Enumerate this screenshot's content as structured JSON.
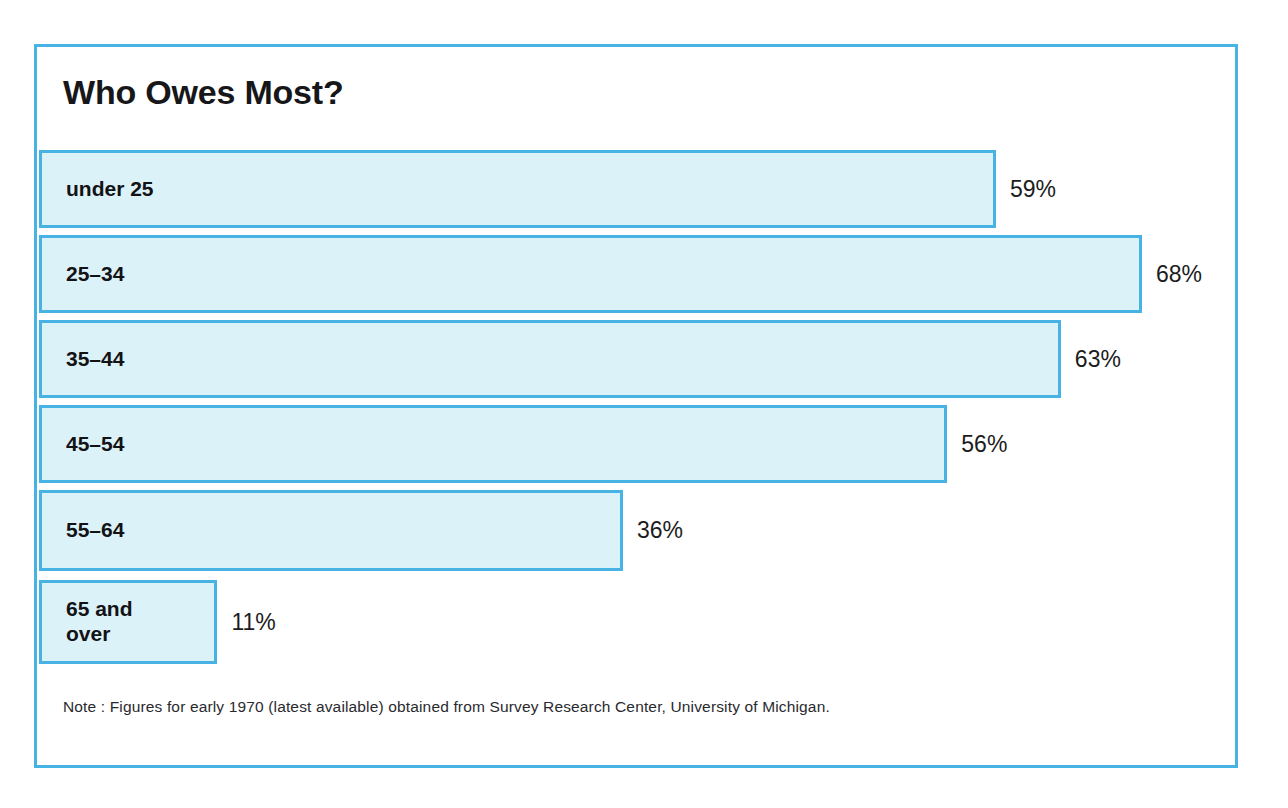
{
  "figure": {
    "title": "Who Owes Most?",
    "footnote": "Note : Figures for early 1970 (latest available) obtained from Survey Research Center, University of Michigan.",
    "border_color": "#46b3e4",
    "bar_fill_color": "#dcf2f9",
    "bar_border_color": "#46b3e4",
    "text_color": "#131316"
  },
  "chart_data": {
    "type": "bar",
    "orientation": "horizontal",
    "title": "Who Owes Most?",
    "xlabel": "",
    "ylabel": "",
    "xlim": [
      0,
      74
    ],
    "grid": false,
    "legend": "none",
    "value_suffix": "%",
    "annotation": "Note : Figures for early 1970 (latest available) obtained from Survey Research Center, University of Michigan.",
    "categories": [
      "under 25",
      "25–34",
      "35–44",
      "45–54",
      "55–64",
      "65 and\nover"
    ],
    "values": [
      59,
      68,
      63,
      56,
      36,
      11
    ],
    "value_labels": [
      "59%",
      "68%",
      "63%",
      "56%",
      "36%",
      "11%"
    ],
    "bars": [
      {
        "label": "under 25",
        "value": 59,
        "value_label": "59%"
      },
      {
        "label": "25–34",
        "value": 68,
        "value_label": "68%"
      },
      {
        "label": "35–44",
        "value": 63,
        "value_label": "63%"
      },
      {
        "label": "45–54",
        "value": 56,
        "value_label": "56%"
      },
      {
        "label": "55–64",
        "value": 36,
        "value_label": "36%"
      },
      {
        "label": "65 and\nover",
        "value": 11,
        "value_label": "11%"
      }
    ]
  }
}
